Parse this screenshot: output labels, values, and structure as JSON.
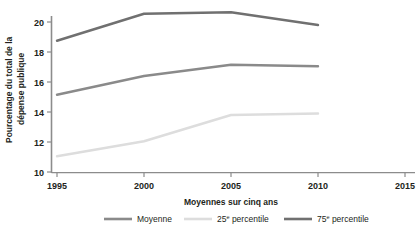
{
  "chart_data": {
    "type": "line",
    "title": "",
    "xlabel": "Moyennes sur cinq ans",
    "ylabel": "Pourcentage du total de la dépense publique",
    "x": [
      1995,
      2000,
      2005,
      2010
    ],
    "xticks": [
      "1995",
      "2000",
      "2005",
      "2010",
      "2015"
    ],
    "xtick_values": [
      1995,
      2000,
      2005,
      2010,
      2015
    ],
    "yticks": [
      "10",
      "12",
      "14",
      "16",
      "18",
      "20"
    ],
    "ytick_values": [
      10,
      12,
      14,
      16,
      18,
      20
    ],
    "xlim": [
      1993.2,
      2016.5
    ],
    "ylim": [
      9.6,
      20.95
    ],
    "grid": false,
    "legend_position": "bottom",
    "series": [
      {
        "name": "Moyenne",
        "color": "#8a8a8a",
        "values": [
          15.15,
          16.4,
          17.15,
          17.05
        ]
      },
      {
        "name": "25e percentile",
        "color": "#dddddd",
        "values": [
          11.05,
          12.05,
          13.8,
          13.9
        ]
      },
      {
        "name": "75e percentile",
        "color": "#707070",
        "values": [
          18.75,
          20.55,
          20.65,
          19.8
        ]
      }
    ]
  },
  "axes": {
    "y_title": "Pourcentage du total de la dépense publique",
    "y_title_line1": "Pourcentage du total de la",
    "y_title_line2": "dépense publique",
    "x_title": "Moyennes sur cinq ans",
    "y_tick_labels": [
      "20",
      "18",
      "16",
      "14",
      "12",
      "10"
    ],
    "x_tick_labels": [
      "1995",
      "2000",
      "2005",
      "2010",
      "2015"
    ]
  },
  "legend": {
    "items": [
      {
        "label": "Moyenne",
        "base": "Moyenne",
        "sup": "",
        "tail": "",
        "color": "#8a8a8a"
      },
      {
        "label": "25e percentile",
        "base": "25",
        "sup": "e",
        "tail": " percentile",
        "color": "#dddddd"
      },
      {
        "label": "75e percentile",
        "base": "75",
        "sup": "e",
        "tail": " percentile",
        "color": "#707070"
      }
    ]
  },
  "colors": {
    "axis": "#8c8c8c",
    "text": "#231f20",
    "background": "#ffffff",
    "series_moyenne": "#8a8a8a",
    "series_p25": "#dddddd",
    "series_p75": "#707070"
  }
}
